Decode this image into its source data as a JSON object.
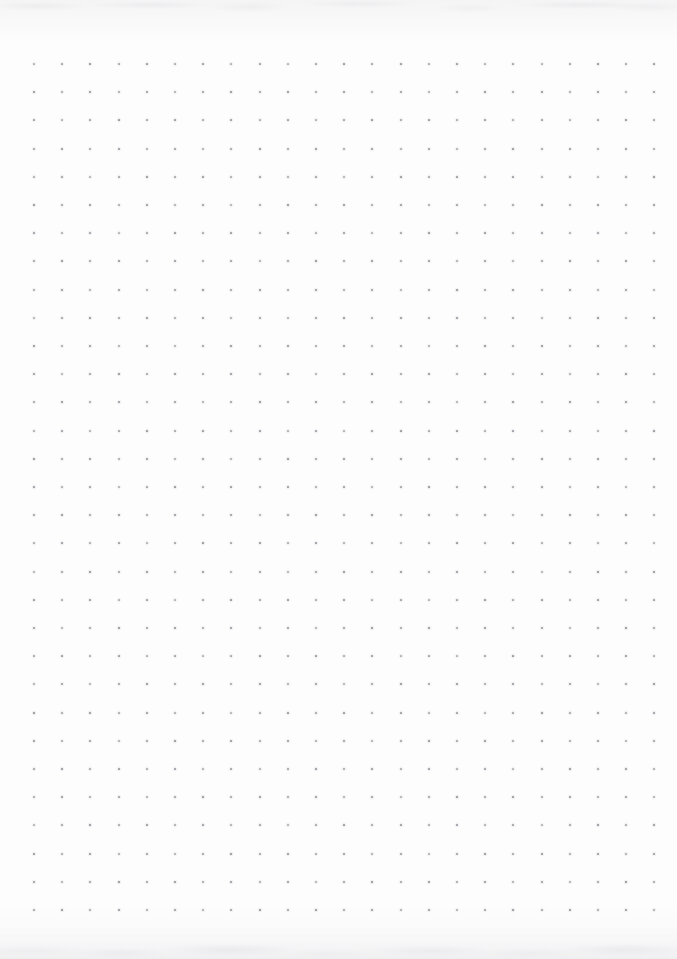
{
  "document": {
    "kind": "dot-grid-paper",
    "description": "Blank dot grid notebook page, scanned",
    "page_width": 677,
    "page_height": 959,
    "background_color": "#fdfdfd",
    "text_content": "",
    "visible_text": []
  },
  "grid": {
    "columns": 23,
    "rows": 31,
    "origin_x": 33,
    "origin_y": 63,
    "spacing_x": 28.2,
    "spacing_y": 28.2,
    "dot_size": 2,
    "dot_color": "#9a9aa2",
    "total_dots": 713
  },
  "margins": {
    "left": 33,
    "right": 31,
    "top": 63,
    "bottom": 54
  },
  "scan_artifacts": {
    "top_edge_shadow": true,
    "bottom_edge_shadow": true,
    "shadow_color": "#eaeaec"
  }
}
